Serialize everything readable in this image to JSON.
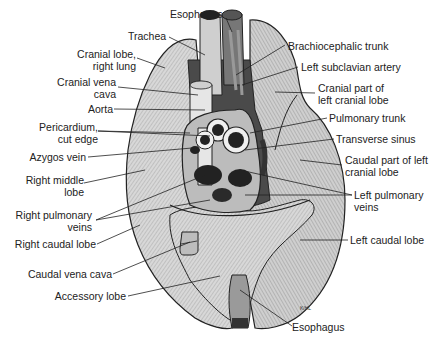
{
  "figure": {
    "signature": "K/HL"
  },
  "labels_left": [
    {
      "id": "esophagus-top",
      "text": "Esophagus"
    },
    {
      "id": "trachea",
      "text": "Trachea"
    },
    {
      "id": "cranial-lobe-right",
      "line1": "Cranial lobe,",
      "line2": "right lung"
    },
    {
      "id": "cranial-vena-cava",
      "line1": "Cranial vena",
      "line2": "cava"
    },
    {
      "id": "aorta",
      "text": "Aorta"
    },
    {
      "id": "pericardium",
      "line1": "Pericardium,",
      "line2": "cut edge"
    },
    {
      "id": "azygos-vein",
      "text": "Azygos vein"
    },
    {
      "id": "right-middle-lobe",
      "line1": "Right middle",
      "line2": "lobe"
    },
    {
      "id": "right-pulmonary-veins",
      "line1": "Right pulmonary",
      "line2": "veins"
    },
    {
      "id": "right-caudal-lobe",
      "text": "Right caudal lobe"
    },
    {
      "id": "caudal-vena-cava",
      "text": "Caudal vena cava"
    },
    {
      "id": "accessory-lobe",
      "text": "Accessory lobe"
    }
  ],
  "labels_right": [
    {
      "id": "brachiocephalic-trunk",
      "text": "Brachiocephalic trunk"
    },
    {
      "id": "left-subclavian-artery",
      "text": "Left subclavian artery"
    },
    {
      "id": "cranial-part-left-cranial-lobe",
      "line1": "Cranial part of",
      "line2": "left cranial lobe"
    },
    {
      "id": "pulmonary-trunk",
      "text": "Pulmonary trunk"
    },
    {
      "id": "transverse-sinus",
      "text": "Transverse sinus"
    },
    {
      "id": "caudal-part-left-cranial-lobe",
      "line1": "Caudal part of left",
      "line2": "cranial lobe"
    },
    {
      "id": "left-pulmonary-veins",
      "line1": "Left pulmonary",
      "line2": "veins"
    },
    {
      "id": "left-caudal-lobe",
      "text": "Left caudal lobe"
    },
    {
      "id": "esophagus-bottom",
      "text": "Esophagus"
    }
  ],
  "colors": {
    "lung_fill": "#d9d9d9",
    "lung_shade": "#a8a8a8",
    "outline": "#222222",
    "vessel": "#eeeeee",
    "dark": "#1e1e1e",
    "text": "#222222"
  }
}
